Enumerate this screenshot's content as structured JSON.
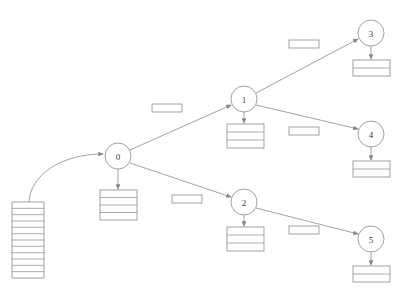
{
  "diagram": {
    "stroke_color": "#8a8a8a",
    "fill_color": "#ffffff",
    "text_color": "#3a3a3a",
    "background": "#ffffff"
  },
  "input_stack": {
    "name": "input-stack",
    "x": 12,
    "y": 202,
    "width": 32,
    "height": 76,
    "rows": 12
  },
  "nodes": [
    {
      "id": "0",
      "label": "0",
      "cx": 118,
      "cy": 156,
      "r": 13,
      "table": {
        "x": 100,
        "y": 190,
        "width": 37,
        "height": 30,
        "rows": 4
      }
    },
    {
      "id": "1",
      "label": "1",
      "cx": 244,
      "cy": 99,
      "r": 13,
      "table": {
        "x": 227,
        "y": 124,
        "width": 37,
        "height": 24,
        "rows": 3
      }
    },
    {
      "id": "2",
      "label": "2",
      "cx": 244,
      "cy": 202,
      "r": 13,
      "table": {
        "x": 227,
        "y": 227,
        "width": 37,
        "height": 24,
        "rows": 3
      }
    },
    {
      "id": "3",
      "label": "3",
      "cx": 371,
      "cy": 33,
      "r": 13,
      "table": {
        "x": 353,
        "y": 60,
        "width": 37,
        "height": 16,
        "rows": 2
      }
    },
    {
      "id": "4",
      "label": "4",
      "cx": 371,
      "cy": 134,
      "r": 13,
      "table": {
        "x": 353,
        "y": 161,
        "width": 37,
        "height": 16,
        "rows": 2
      }
    },
    {
      "id": "5",
      "label": "5",
      "cx": 371,
      "cy": 239,
      "r": 13,
      "table": {
        "x": 353,
        "y": 266,
        "width": 37,
        "height": 16,
        "rows": 2
      }
    }
  ],
  "edges": [
    {
      "name": "edge-0-1",
      "from": "0",
      "to": "1",
      "x1": 130,
      "y1": 150,
      "x2": 231,
      "y2": 105
    },
    {
      "name": "edge-0-2",
      "from": "0",
      "to": "2",
      "x1": 130,
      "y1": 163,
      "x2": 231,
      "y2": 197
    },
    {
      "name": "edge-1-3",
      "from": "1",
      "to": "3",
      "x1": 256,
      "y1": 93,
      "x2": 358,
      "y2": 39
    },
    {
      "name": "edge-1-4",
      "from": "1",
      "to": "4",
      "x1": 256,
      "y1": 105,
      "x2": 358,
      "y2": 129
    },
    {
      "name": "edge-2-5",
      "from": "2",
      "to": "5",
      "x1": 256,
      "y1": 208,
      "x2": 358,
      "y2": 234
    }
  ],
  "node_to_table_arrows": [
    {
      "name": "arrow-node-0-table",
      "x": 118,
      "y1": 169,
      "y2": 189
    },
    {
      "name": "arrow-node-1-table",
      "x": 244,
      "y1": 112,
      "y2": 123
    },
    {
      "name": "arrow-node-2-table",
      "x": 244,
      "y1": 215,
      "y2": 226
    },
    {
      "name": "arrow-node-3-table",
      "x": 371,
      "y1": 46,
      "y2": 59
    },
    {
      "name": "arrow-node-4-table",
      "x": 371,
      "y1": 147,
      "y2": 160
    },
    {
      "name": "arrow-node-5-table",
      "x": 371,
      "y1": 252,
      "y2": 265
    }
  ],
  "input_arrow": {
    "name": "input-stack-to-node-0-arrow",
    "path": "M 29 202 C 30 176 60 154 103 154"
  },
  "edge_labels": [
    {
      "name": "edge-label-0-1",
      "text": "",
      "x": 152,
      "y": 104,
      "width": 30,
      "height": 8
    },
    {
      "name": "edge-label-1-3",
      "text": "",
      "x": 289,
      "y": 40,
      "width": 30,
      "height": 8
    },
    {
      "name": "edge-label-1-4",
      "text": "",
      "x": 289,
      "y": 127,
      "width": 30,
      "height": 8
    },
    {
      "name": "edge-label-0-2",
      "text": "",
      "x": 172,
      "y": 195,
      "width": 30,
      "height": 8
    },
    {
      "name": "edge-label-2-5",
      "text": "",
      "x": 289,
      "y": 226,
      "width": 30,
      "height": 8
    }
  ]
}
